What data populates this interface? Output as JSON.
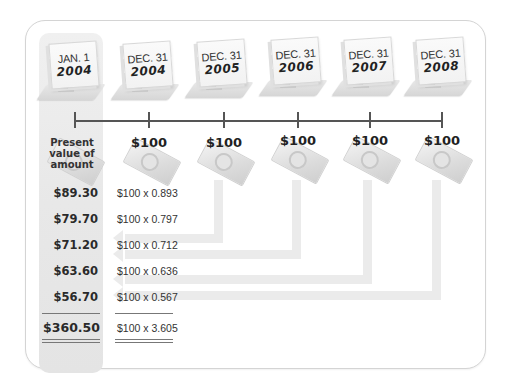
{
  "diagram": {
    "dates": [
      {
        "month": "JAN. 1",
        "year": "2004"
      },
      {
        "month": "DEC. 31",
        "year": "2004"
      },
      {
        "month": "DEC. 31",
        "year": "2005"
      },
      {
        "month": "DEC. 31",
        "year": "2006"
      },
      {
        "month": "DEC. 31",
        "year": "2007"
      },
      {
        "month": "DEC. 31",
        "year": "2008"
      }
    ],
    "first_column_label": "Present value of amount",
    "payments": [
      "$100",
      "$100",
      "$100",
      "$100",
      "$100"
    ],
    "rows": [
      {
        "present_value": "$89.30",
        "formula": "$100 x 0.893"
      },
      {
        "present_value": "$79.70",
        "formula": "$100 x 0.797"
      },
      {
        "present_value": "$71.20",
        "formula": "$100 x 0.712"
      },
      {
        "present_value": "$63.60",
        "formula": "$100 x 0.636"
      },
      {
        "present_value": "$56.70",
        "formula": "$100 x 0.567"
      }
    ],
    "total": {
      "present_value": "$360.50",
      "formula": "$100 x 3.605"
    },
    "icons": {
      "calendar": "desk-calendar-icon",
      "money": "dollar-bill-icon"
    },
    "colors": {
      "line": "#555555",
      "connector": "#ebebeb",
      "panel": "#e8e8e8",
      "border": "#d4d4d4"
    }
  }
}
